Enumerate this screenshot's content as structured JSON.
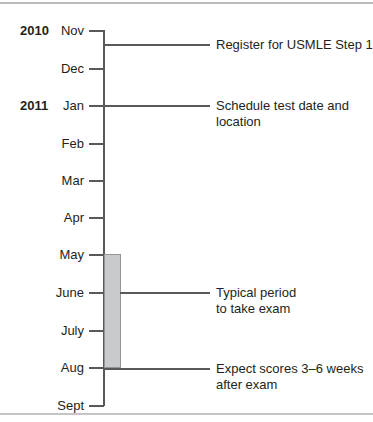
{
  "chart_data": {
    "type": "timeline",
    "orientation": "vertical",
    "axis_label": "",
    "categories": [
      "Nov",
      "Dec",
      "Jan",
      "Feb",
      "Mar",
      "Apr",
      "May",
      "June",
      "July",
      "Aug",
      "Sept"
    ],
    "year_groups": [
      {
        "year": "2010",
        "start_month": "Nov"
      },
      {
        "year": "2011",
        "start_month": "Jan"
      }
    ],
    "ticks": [
      {
        "label": "Nov",
        "y": 30
      },
      {
        "label": "Dec",
        "y": 68
      },
      {
        "label": "Jan",
        "y": 105
      },
      {
        "label": "Feb",
        "y": 143
      },
      {
        "label": "Mar",
        "y": 180
      },
      {
        "label": "Apr",
        "y": 217
      },
      {
        "label": "May",
        "y": 254
      },
      {
        "label": "June",
        "y": 292
      },
      {
        "label": "July",
        "y": 330
      },
      {
        "label": "Aug",
        "y": 367
      },
      {
        "label": "Sept",
        "y": 405
      }
    ],
    "bands": [
      {
        "name": "typical-exam-period",
        "from": "May",
        "to": "Aug",
        "y_top": 254,
        "y_bottom": 367,
        "color": "#c9cacc",
        "border_color": "#939598"
      }
    ],
    "events": [
      {
        "text": "Register for USMLE Step 1",
        "y": 44,
        "anchor": "axis",
        "between": [
          "Nov",
          "Dec"
        ]
      },
      {
        "text": "Schedule test date and\nlocation",
        "y": 105,
        "anchor": "axis",
        "at": "Jan"
      },
      {
        "text": "Typical period\nto take exam",
        "y": 292,
        "anchor": "band-right",
        "at": "June"
      },
      {
        "text": "Expect scores 3–6 weeks\nafter exam",
        "y": 368,
        "anchor": "axis",
        "between": [
          "Aug",
          "Sept"
        ]
      }
    ],
    "colors": {
      "axis": "#58595b",
      "text": "#231f20",
      "band_fill": "#c9cacc",
      "band_border": "#939598",
      "rule": "#b9bbbd"
    }
  },
  "years": [
    {
      "label": "2010",
      "top": 24
    },
    {
      "label": "2011",
      "top": 99
    }
  ],
  "months": [
    {
      "label": "Nov",
      "top": 24,
      "tick_top": 30
    },
    {
      "label": "Dec",
      "top": 62,
      "tick_top": 68
    },
    {
      "label": "Jan",
      "top": 99,
      "tick_top": 105
    },
    {
      "label": "Feb",
      "top": 137,
      "tick_top": 143
    },
    {
      "label": "Mar",
      "top": 174,
      "tick_top": 180
    },
    {
      "label": "Apr",
      "top": 211,
      "tick_top": 217
    },
    {
      "label": "May",
      "top": 248,
      "tick_top": 254
    },
    {
      "label": "June",
      "top": 286,
      "tick_top": 292
    },
    {
      "label": "July",
      "top": 324,
      "tick_top": 330
    },
    {
      "label": "Aug",
      "top": 361,
      "tick_top": 367
    },
    {
      "label": "Sept",
      "top": 399,
      "tick_top": 405
    }
  ],
  "band": {
    "top": 254,
    "height": 114
  },
  "annotations": [
    {
      "text": "Register for USMLE Step 1",
      "text_top": 37,
      "leader_top": 44,
      "leader_left": 104,
      "leader_width": 106
    },
    {
      "text": "Schedule test date and\nlocation",
      "text_top": 98,
      "leader_top": 105,
      "leader_left": 104,
      "leader_width": 106
    },
    {
      "text": "Typical period\nto take exam",
      "text_top": 285,
      "leader_top": 292,
      "leader_left": 120,
      "leader_width": 90
    },
    {
      "text": "Expect scores 3–6 weeks\nafter exam",
      "text_top": 361,
      "leader_top": 368,
      "leader_left": 104,
      "leader_width": 106
    }
  ]
}
